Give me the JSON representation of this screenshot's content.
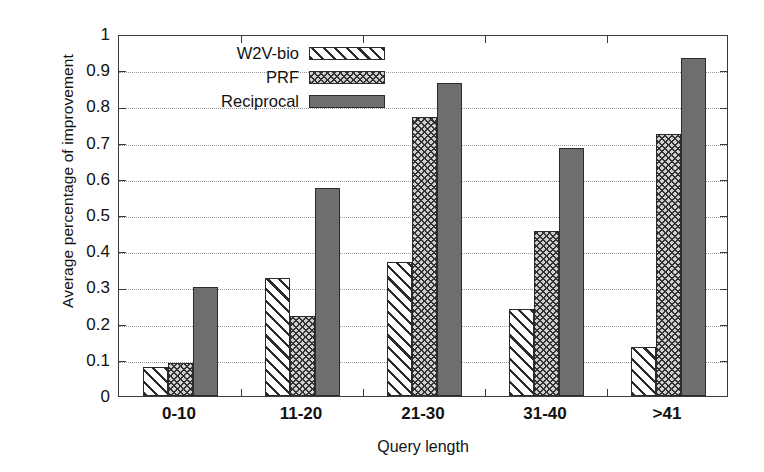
{
  "chart_data": {
    "type": "bar",
    "title": "",
    "xlabel": "Query length",
    "ylabel": "Average percentage of improvement",
    "categories": [
      "0-10",
      "11-20",
      "21-30",
      "31-40",
      ">41"
    ],
    "series": [
      {
        "name": "W2V-bio",
        "values": [
          0.08,
          0.325,
          0.37,
          0.24,
          0.135
        ],
        "fill": "diagonal-hatch",
        "color": "#ffffff"
      },
      {
        "name": "PRF",
        "values": [
          0.09,
          0.22,
          0.77,
          0.455,
          0.725
        ],
        "fill": "cross-dot",
        "color": "#cfcfcf"
      },
      {
        "name": "Reciprocal",
        "values": [
          0.3,
          0.575,
          0.865,
          0.685,
          0.935
        ],
        "fill": "solid",
        "color": "#6e6e6e"
      }
    ],
    "ylim": [
      0,
      1
    ],
    "ytick_values": [
      0,
      0.1,
      0.2,
      0.3,
      0.4,
      0.5,
      0.6,
      0.7,
      0.8,
      0.9,
      1
    ],
    "ytick_labels": [
      "0",
      "0.1",
      "0.2",
      "0.3",
      "0.4",
      "0.5",
      "0.6",
      "0.7",
      "0.8",
      "0.9",
      "1"
    ],
    "grid": true,
    "grid_style": "dotted-horizontal",
    "legend_position": "top-left-inside",
    "axis_color": "#3a3a3a",
    "grid_color": "#9a9a9a",
    "background": "#ffffff"
  }
}
